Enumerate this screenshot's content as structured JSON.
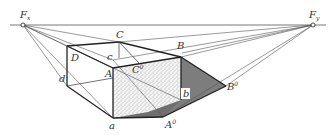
{
  "figure": {
    "type": "perspective-shadow-construction",
    "colors": {
      "line": "#222222",
      "thin_line": "#555555",
      "shadow": "#7a7a7a",
      "stipple_face": "#f2f2f2",
      "background": "#ffffff"
    }
  },
  "labels": {
    "Fx": {
      "main": "F",
      "sub": "x"
    },
    "Fy": {
      "main": "F",
      "sub": "y"
    },
    "C": "C",
    "B": "B",
    "D": "D",
    "c": "c",
    "A": "A",
    "C0": {
      "main": "C",
      "sup": "0"
    },
    "d": "d",
    "b": "b",
    "B0": {
      "main": "B",
      "sup": "0"
    },
    "a": "a",
    "A0": {
      "main": "A",
      "sup": "0"
    }
  }
}
